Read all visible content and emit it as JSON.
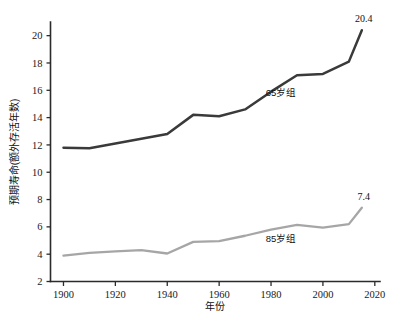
{
  "chart_data": {
    "type": "line",
    "title": "",
    "xlabel": "年份",
    "ylabel": "预期寿命(额外存活年数)",
    "xlim": [
      1895,
      2022
    ],
    "ylim": [
      2,
      21
    ],
    "xticks": [
      1900,
      1920,
      1940,
      1960,
      1980,
      2000,
      2020
    ],
    "yticks": [
      2,
      4,
      6,
      8,
      10,
      12,
      14,
      16,
      18,
      20
    ],
    "grid": false,
    "legend_position": "inline-annotation",
    "x": [
      1900,
      1910,
      1920,
      1930,
      1940,
      1950,
      1960,
      1970,
      1980,
      1990,
      2000,
      2010,
      2015
    ],
    "series": [
      {
        "name": "65岁组",
        "color": "#3a3a3a",
        "label_x": 1978,
        "label_y": 15.6,
        "end_annotation": "20.4",
        "values": [
          11.8,
          11.75,
          12.1,
          12.45,
          12.8,
          14.2,
          14.1,
          14.6,
          15.9,
          17.1,
          17.2,
          18.1,
          20.4
        ]
      },
      {
        "name": "85岁组",
        "color": "#a6a6a6",
        "label_x": 1978,
        "label_y": 4.9,
        "end_annotation": "7.4",
        "values": [
          3.9,
          4.1,
          4.2,
          4.3,
          4.05,
          4.9,
          4.95,
          5.35,
          5.8,
          6.15,
          5.95,
          6.2,
          7.4
        ]
      }
    ]
  },
  "axis": {
    "y_tick_labels": [
      "2",
      "4",
      "6",
      "8",
      "10",
      "12",
      "14",
      "16",
      "18",
      "20"
    ],
    "x_tick_labels": [
      "1900",
      "1920",
      "1940",
      "1960",
      "1980",
      "2000",
      "2020"
    ],
    "x_title": "年份",
    "y_title": "预期寿命(额外存活年数)"
  },
  "annotations": {
    "primary_end_value": "20.4",
    "secondary_end_value": "7.4",
    "primary_series_label": "65岁组",
    "secondary_series_label": "85岁组"
  },
  "colors": {
    "primary_line": "#3a3a3a",
    "secondary_line": "#a6a6a6",
    "axis": "#2b2b2b",
    "text": "#111111",
    "background": "#ffffff"
  }
}
